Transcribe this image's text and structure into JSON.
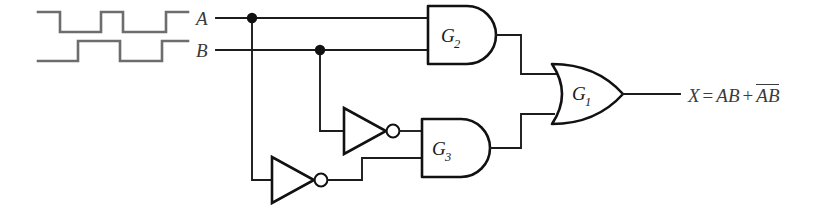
{
  "diagram": {
    "background_color": "#ffffff",
    "wire_color": "#1c1c1c",
    "waveform_color": "#6d6d6d",
    "gate_fill": "#ffffff"
  },
  "signals": {
    "input_a_label": "A",
    "input_b_label": "B",
    "output_label": "X",
    "equals": "=",
    "plus": "+",
    "term_ab": "AB",
    "term_a_bar": "A",
    "term_b_bar": "B",
    "output_expression": "X = AB + ĀB̄"
  },
  "gates": [
    {
      "id": "G1",
      "label": "G",
      "subscript": "1",
      "type": "OR",
      "inputs": [
        "G2 output",
        "G3 output"
      ],
      "output": "X"
    },
    {
      "id": "G2",
      "label": "G",
      "subscript": "2",
      "type": "AND",
      "inputs": [
        "A",
        "B"
      ],
      "output": "AB"
    },
    {
      "id": "G3",
      "label": "G",
      "subscript": "3",
      "type": "AND",
      "inputs": [
        "NOT B",
        "NOT A"
      ],
      "output": "ĀB̄"
    }
  ],
  "inverters": [
    {
      "id": "INV_B",
      "type": "NOT",
      "input": "B",
      "output": "B̄"
    },
    {
      "id": "INV_A",
      "type": "NOT",
      "input": "A",
      "output": "Ā"
    }
  ],
  "junctions": [
    {
      "id": "node-a",
      "signal": "A"
    },
    {
      "id": "node-b",
      "signal": "B"
    }
  ],
  "waveforms": {
    "a": {
      "name": "A",
      "levels": [
        1,
        0,
        1,
        0,
        1
      ],
      "description": "high, low, high, low, high"
    },
    "b": {
      "name": "B",
      "levels": [
        0,
        1,
        0,
        1
      ],
      "description": "low, high, low, high"
    }
  }
}
